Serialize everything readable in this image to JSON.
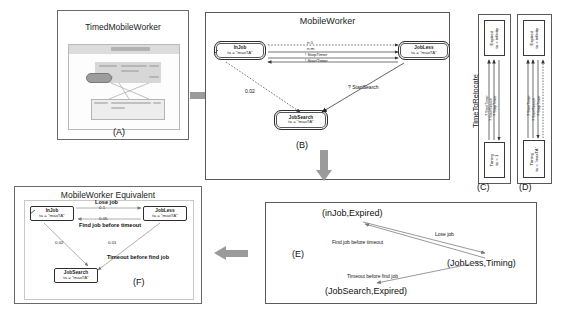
{
  "figure": {
    "background": "#ffffff",
    "line_color": "#2e2e2e",
    "arrow_color": "#9b9b9b"
  },
  "panels": {
    "a": {
      "caption": "(A)",
      "title": "TimedMobileWorker",
      "screenshot_note": "blurred model-editor screenshot"
    },
    "b": {
      "caption": "(B)",
      "title": "MobileWorker",
      "nodes": [
        {
          "id": "injob",
          "name": "InJob",
          "ta": "ta = \"maxTA\""
        },
        {
          "id": "jobless",
          "name": "JobLess",
          "ta": "ta = \"maxTA\""
        },
        {
          "id": "jobsearch",
          "name": "JobSearch",
          "ta": "ta = \"maxTA\""
        }
      ],
      "edge_labels": [
        {
          "id": "n1",
          "text": "n:1"
        },
        {
          "id": "nm",
          "text": "n:m"
        },
        {
          "id": "stoptimer",
          "text": "! StopTimer"
        },
        {
          "id": "starttimer",
          "text": "! StartTimer"
        },
        {
          "id": "startsearch",
          "text": "? StartSearch"
        },
        {
          "id": "prob",
          "text": "0.02"
        }
      ]
    },
    "c": {
      "caption": "(C)",
      "title": "TimeToRelocate",
      "nodes": [
        {
          "id": "expired",
          "name": "Expired",
          "ta": "ta = infinity"
        },
        {
          "id": "timing",
          "name": "Timing",
          "ta": "ta = 1"
        }
      ],
      "edge_labels": [
        {
          "id": "stoptimer",
          "text": "? StopTimer"
        },
        {
          "id": "startsearch",
          "text": "? StartSearch"
        },
        {
          "id": "starttimer",
          "text": "? StartTimer"
        }
      ]
    },
    "d": {
      "caption": "(D)",
      "nodes": [
        {
          "id": "expired",
          "name": "Expired",
          "ta": "ta = infinity"
        },
        {
          "id": "timing",
          "name": "Timing",
          "ta": "ta = \"maxTA\""
        }
      ],
      "edge_labels": [
        {
          "id": "stoptimer",
          "text": "? StopTimer"
        },
        {
          "id": "startsearch",
          "text": "? StartSearch"
        },
        {
          "id": "starttimer",
          "text": "? StartTimer"
        }
      ]
    },
    "e": {
      "caption": "(E)",
      "nodes": [
        {
          "id": "injob_expired",
          "text": "(inJob,Expired)"
        },
        {
          "id": "jobless_timing",
          "text": "(JobLess,Timing)"
        },
        {
          "id": "jobsearch_expired",
          "text": "(JobSearch,Expired)"
        }
      ],
      "edge_labels": [
        {
          "id": "lose_job",
          "text": "Lose job"
        },
        {
          "id": "find_job",
          "text": "Find job before timeout"
        },
        {
          "id": "timeout",
          "text": "Timeout before find job"
        }
      ]
    },
    "f": {
      "caption": "(F)",
      "title": "MobileWorker Equivalent",
      "nodes": [
        {
          "id": "injob",
          "name": "InJob",
          "ta": "ta = \"maxTA\""
        },
        {
          "id": "jobless",
          "name": "JobLess",
          "ta": "ta = \"maxTA\""
        },
        {
          "id": "jobsearch",
          "name": "JobSearch",
          "ta": "ta = \"maxTA\""
        }
      ],
      "edge_labels": [
        {
          "id": "lose_job",
          "text": "Lose job"
        },
        {
          "id": "find_job",
          "text": "Find job before timeout"
        },
        {
          "id": "timeout",
          "text": "Timeout before find job"
        },
        {
          "id": "p1",
          "text": "0.1"
        },
        {
          "id": "p2",
          "text": "0.05"
        },
        {
          "id": "p3",
          "text": "0.02"
        },
        {
          "id": "p4",
          "text": "0.01"
        }
      ]
    }
  }
}
